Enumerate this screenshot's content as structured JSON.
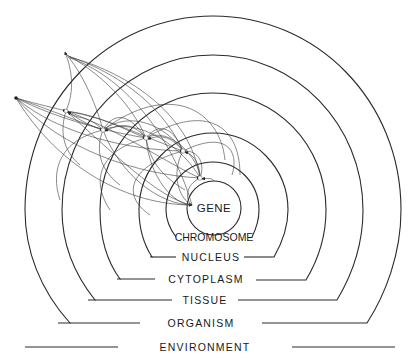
{
  "diagram": {
    "type": "nested-levels",
    "levels": [
      {
        "name": "gene",
        "label": "GENE"
      },
      {
        "name": "chromosome",
        "label": "CHROMOSOME"
      },
      {
        "name": "nucleus",
        "label": "NUCLEUS"
      },
      {
        "name": "cytoplasm",
        "label": "CYTOPLASM"
      },
      {
        "name": "tissue",
        "label": "TISSUE"
      },
      {
        "name": "organism",
        "label": "ORGANISM"
      },
      {
        "name": "environment",
        "label": "ENVIRONMENT"
      }
    ],
    "colors": {
      "line": "#2a2a2a",
      "background": "#ffffff"
    }
  }
}
